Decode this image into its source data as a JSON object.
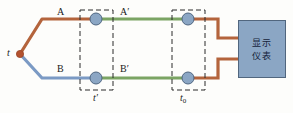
{
  "diagram": {
    "title_labels": {
      "hot_junction": "t",
      "wire_a": "A",
      "wire_b": "B",
      "wire_a_prime": "A′",
      "wire_b_prime": "B′",
      "junction_box_left": "t′",
      "junction_box_right_base": "t",
      "junction_box_right_sub": "0"
    },
    "meter": {
      "line1": "显示",
      "line2": "仪表"
    },
    "colors": {
      "wire_orange": "#b4643c",
      "wire_blue": "#7b9ac4",
      "wire_green": "#7ba463",
      "node_fill": "#8ba6c4",
      "node_stroke": "#4f6681",
      "hot_junction_dot": "#b4522f",
      "dashed_box": "#2a2a2a",
      "meter_fill": "#8ba6c4",
      "meter_stroke": "#51667e",
      "background": "#fdfdfb"
    },
    "nodes": [
      {
        "name": "node-a-prime-left",
        "x": 96,
        "y": 19
      },
      {
        "name": "node-b-prime-left",
        "x": 96,
        "y": 78
      },
      {
        "name": "node-a-prime-right",
        "x": 188,
        "y": 19
      },
      {
        "name": "node-b-prime-right",
        "x": 188,
        "y": 78
      }
    ],
    "dashed_boxes": [
      {
        "name": "box-t-prime",
        "x": 80,
        "y": 10,
        "w": 33,
        "h": 80
      },
      {
        "name": "box-t-zero",
        "x": 172,
        "y": 10,
        "w": 33,
        "h": 80
      }
    ]
  }
}
